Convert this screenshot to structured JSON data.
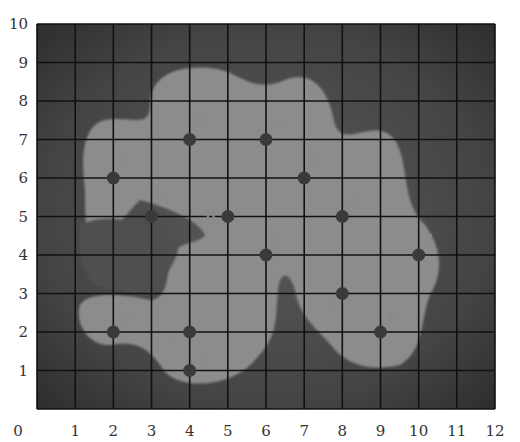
{
  "map": {
    "x_axis": {
      "min": 0,
      "max": 12,
      "ticks": [
        "0",
        "1",
        "2",
        "3",
        "4",
        "5",
        "6",
        "7",
        "8",
        "9",
        "10",
        "11",
        "12"
      ]
    },
    "y_axis": {
      "min": 0,
      "max": 10,
      "ticks": [
        "0",
        "1",
        "2",
        "3",
        "4",
        "5",
        "6",
        "7",
        "8",
        "9",
        "10"
      ]
    },
    "colors": {
      "background": "#ffffff",
      "dark_region": "#3e3e3e",
      "light_region": "#8c8c8c",
      "grid": "#111111",
      "point": "#3a3a3a",
      "label": "#8a8a8a",
      "tick_text": "#333333"
    },
    "points": [
      {
        "id": "A",
        "x": 4,
        "y": 2,
        "label_dx": -0.45,
        "label_dy": -0.2
      },
      {
        "id": "B",
        "x": 2,
        "y": 6,
        "label_dx": 0.3,
        "label_dy": 0.45
      },
      {
        "id": "C",
        "x": 6,
        "y": 4,
        "label_dx": 0.25,
        "label_dy": 0.35
      },
      {
        "id": "D",
        "x": 8,
        "y": 3,
        "label_dx": -0.3,
        "label_dy": -0.35
      },
      {
        "id": "E",
        "x": 8,
        "y": 5,
        "label_dx": 0.3,
        "label_dy": 0.35
      },
      {
        "id": "F",
        "x": 9,
        "y": 2,
        "label_dx": 0.3,
        "label_dy": 0.35
      },
      {
        "id": "G",
        "x": 6,
        "y": 7,
        "label_dx": 0.3,
        "label_dy": 0.4
      },
      {
        "id": "H",
        "x": 5,
        "y": 5,
        "label_dx": -0.45,
        "label_dy": 0.05
      },
      {
        "id": "I",
        "x": 10,
        "y": 4,
        "label_dx": 0.3,
        "label_dy": 0.4
      },
      {
        "id": "J",
        "x": 4,
        "y": 1,
        "label_dx": 0.45,
        "label_dy": 0.3
      },
      {
        "id": "K",
        "x": 4,
        "y": 7,
        "label_dx": 0.3,
        "label_dy": 0.45
      },
      {
        "id": "L",
        "x": 7,
        "y": 6,
        "label_dx": 0.3,
        "label_dy": 0.4
      },
      {
        "id": "M",
        "x": 2,
        "y": 2,
        "label_dx": 0.3,
        "label_dy": 0.35
      },
      {
        "id": "N",
        "x": 3,
        "y": 5,
        "label_dx": 0.35,
        "label_dy": 0.4
      }
    ]
  }
}
